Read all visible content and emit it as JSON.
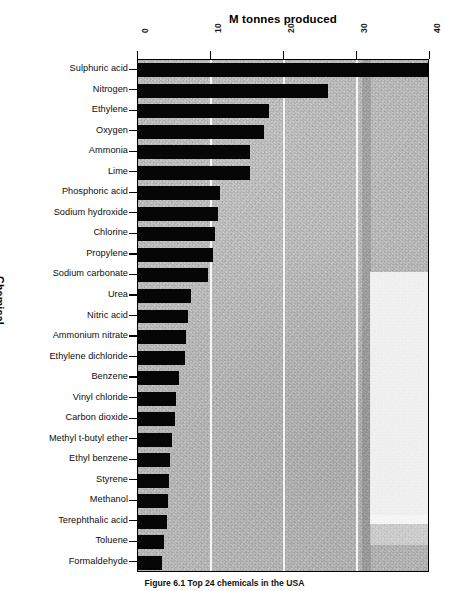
{
  "figure": {
    "caption": "Figure 6.1   Top 24 chemicals in the USA"
  },
  "chart_data": {
    "type": "bar",
    "orientation": "horizontal",
    "title": "M tonnes produced",
    "xlabel": "M tonnes produced",
    "ylabel": "Chemical",
    "xlim": [
      0,
      40
    ],
    "xticks": [
      0,
      10,
      20,
      30,
      40
    ],
    "xtick_labels": [
      "0",
      "10",
      "20",
      "30",
      "40"
    ],
    "grid": "vertical-only",
    "legend": "none",
    "categories": [
      "Sulphuric acid",
      "Nitrogen",
      "Ethylene",
      "Oxygen",
      "Ammonia",
      "Lime",
      "Phosphoric acid",
      "Sodium hydroxide",
      "Chlorine",
      "Propylene",
      "Sodium carbonate",
      "Urea",
      "Nitric acid",
      "Ammonium nitrate",
      "Ethylene dichloride",
      "Benzene",
      "Vinyl chloride",
      "Carbon dioxide",
      "Methyl t-butyl ether",
      "Ethyl benzene",
      "Styrene",
      "Methanol",
      "Terephthalic acid",
      "Toluene",
      "Formaldehyde"
    ],
    "values": [
      39.7,
      26.0,
      18.0,
      17.2,
      15.4,
      15.3,
      11.2,
      11.0,
      10.6,
      10.3,
      9.6,
      7.3,
      6.9,
      6.6,
      6.5,
      5.6,
      5.2,
      5.1,
      4.6,
      4.4,
      4.2,
      4.1,
      4.0,
      3.6,
      3.3
    ]
  },
  "colors": {
    "bar": "#060606",
    "plot_background": "#dcdcdc",
    "gridline": "#f6f6f6",
    "axis": "#000000",
    "text": "#0d0d0d"
  }
}
